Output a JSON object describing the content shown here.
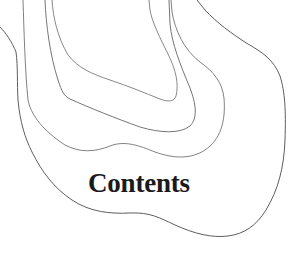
{
  "page": {
    "heading": "Contents",
    "background_color": "#ffffff",
    "heading_color": "#1a1a1a"
  },
  "illustration": {
    "type": "topographic-contour-lines",
    "line_color": "#6e6e6e",
    "contour_count": 4
  }
}
